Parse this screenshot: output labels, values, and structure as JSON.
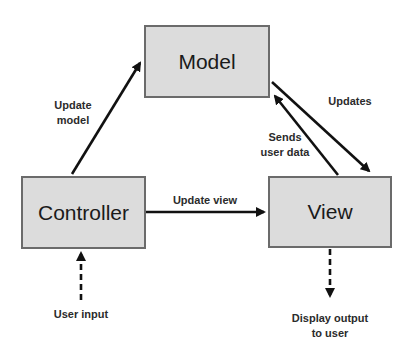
{
  "diagram": {
    "colors": {
      "box_fill": "#dcdcdc",
      "box_border": "#6b6b6b",
      "arrow": "#111111",
      "text": "#1a1a1a"
    },
    "nodes": {
      "model": {
        "label": "Model"
      },
      "controller": {
        "label": "Controller"
      },
      "view": {
        "label": "View"
      }
    },
    "edges": {
      "update_model": {
        "from": "controller",
        "to": "model",
        "label_line1": "Update",
        "label_line2": "model",
        "style": "solid"
      },
      "updates": {
        "from": "model",
        "to": "view",
        "label": "Updates",
        "style": "solid"
      },
      "sends_user_data": {
        "from": "view",
        "to": "model",
        "label_line1": "Sends",
        "label_line2": "user data",
        "style": "solid"
      },
      "update_view": {
        "from": "controller",
        "to": "view",
        "label": "Update view",
        "style": "solid"
      },
      "user_input": {
        "from": "external",
        "to": "controller",
        "label": "User input",
        "style": "dashed"
      },
      "display_output": {
        "from": "view",
        "to": "external",
        "label_line1": "Display output",
        "label_line2": "to user",
        "style": "dashed"
      }
    }
  }
}
